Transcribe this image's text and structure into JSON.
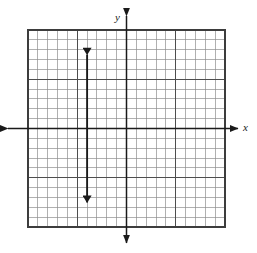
{
  "figure": {
    "kind": "coordinate-plane-graph",
    "background_color": "#ffffff",
    "ink_color": "#2b2b2b",
    "axis_color": "#1a1a1a",
    "grid_minor_color": "#8a8a8a",
    "grid_major_color": "#4a4a4a",
    "x_axis_label": "x",
    "y_axis_label": "y"
  },
  "chart_data": {
    "type": "line",
    "title": "",
    "xlabel": "x",
    "ylabel": "y",
    "grid": true,
    "legend": null,
    "xlim": [
      -10,
      10
    ],
    "ylim": [
      -10,
      10
    ],
    "x_major_step": 5,
    "y_major_step": 5,
    "x_minor_step": 1,
    "y_minor_step": 1,
    "tick_labels_shown": false,
    "series": [
      {
        "name": "vertical-line",
        "equation": "x = -4",
        "style": "solid",
        "arrows": "both",
        "points": [
          {
            "x": -4,
            "y": 7.5
          },
          {
            "x": -4,
            "y": -7.5
          }
        ]
      }
    ],
    "annotations": [
      {
        "text": "x",
        "role": "x-axis-label",
        "position": "right-of-x-axis"
      },
      {
        "text": "y",
        "role": "y-axis-label",
        "position": "above-y-axis"
      }
    ]
  },
  "geometry": {
    "grid_left": 28,
    "grid_top": 30,
    "grid_right": 225,
    "grid_bottom": 227,
    "cell": 9.85,
    "origin_x": 126.5,
    "origin_y": 128.5,
    "x_axis_arrow_left": 8,
    "x_axis_arrow_right": 238,
    "y_axis_arrow_top": 16,
    "y_axis_arrow_bottom": 243,
    "line_x": 86.8,
    "line_top": 55,
    "line_bottom": 203
  }
}
